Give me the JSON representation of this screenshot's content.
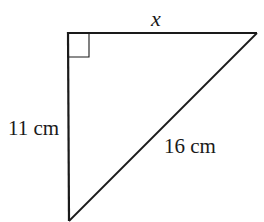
{
  "diagram": {
    "type": "right-triangle",
    "colors": {
      "stroke": "#1a1a1a",
      "background": "#ffffff"
    },
    "vertices": {
      "right_angle": [
        68,
        33
      ],
      "top_right": [
        257,
        33
      ],
      "bottom": [
        69,
        221
      ]
    },
    "right_angle_marker": true,
    "labels": {
      "top_side": "x",
      "left_side": "11 cm",
      "hypotenuse": "16 cm"
    }
  }
}
